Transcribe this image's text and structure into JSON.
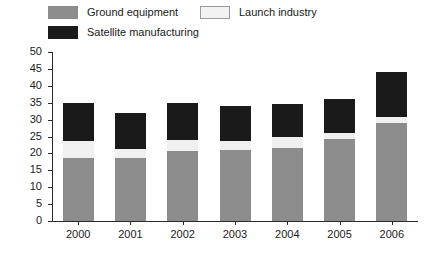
{
  "chart_data": {
    "type": "bar",
    "stacked": true,
    "title": "",
    "xlabel": "",
    "ylabel": "Revenues in billions of US$",
    "categories": [
      "2000",
      "2001",
      "2002",
      "2003",
      "2004",
      "2005",
      "2006"
    ],
    "ylim": [
      0,
      50
    ],
    "yticks": [
      0,
      5,
      10,
      15,
      20,
      25,
      30,
      35,
      40,
      45,
      50
    ],
    "ytick_labels": [
      "0",
      "5",
      "10",
      "15",
      "20",
      "25",
      "30",
      "35",
      "40",
      "45",
      "50"
    ],
    "grid": false,
    "legend_position": "top",
    "series": [
      {
        "name": "Ground equipment",
        "color": "#8c8c8c",
        "values": [
          18.5,
          18.6,
          20.7,
          21.0,
          21.5,
          24.3,
          29.0
        ]
      },
      {
        "name": "Launch industry",
        "color": "#f0f0f0",
        "values": [
          5.2,
          2.7,
          3.3,
          2.7,
          3.3,
          1.8,
          1.8
        ]
      },
      {
        "name": "Satellite manufacturing",
        "color": "#1a1a1a",
        "values": [
          11.3,
          10.7,
          11.0,
          10.3,
          9.7,
          9.9,
          13.2
        ]
      }
    ],
    "totals": [
      35.0,
      32.0,
      35.0,
      34.0,
      34.5,
      36.0,
      44.0
    ]
  },
  "legend": {
    "items": [
      {
        "label": "Ground equipment",
        "swatch": "grey-swatch-icon"
      },
      {
        "label": "Launch industry",
        "swatch": "white-swatch-icon"
      },
      {
        "label": "Satellite manufacturing",
        "swatch": "black-swatch-icon"
      }
    ]
  }
}
